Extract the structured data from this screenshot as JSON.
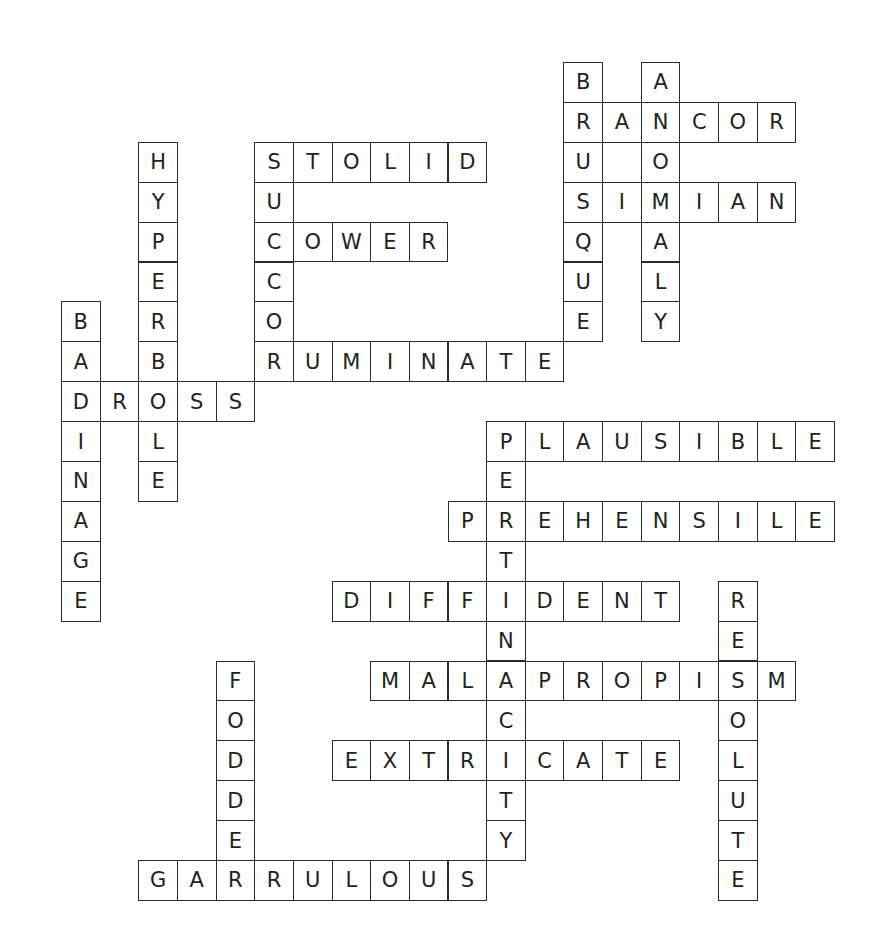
{
  "puzzle": {
    "type": "crossword-solution",
    "grid": {
      "origin_x": 61,
      "origin_y": 62,
      "cell_w": 38.65,
      "cell_h": 39.9
    },
    "colors": {
      "border": "#2a2a2a",
      "letter": "#222222",
      "background": "#ffffff"
    },
    "words": [
      {
        "word": "BRUSQUE",
        "dir": "down",
        "row": 0,
        "col": 13
      },
      {
        "word": "ANOMALY",
        "dir": "down",
        "row": 0,
        "col": 15
      },
      {
        "word": "RANCOR",
        "dir": "across",
        "row": 1,
        "col": 13
      },
      {
        "word": "SIMIAN",
        "dir": "across",
        "row": 3,
        "col": 13
      },
      {
        "word": "HYPERBOLE",
        "dir": "down",
        "row": 2,
        "col": 2
      },
      {
        "word": "STOLID",
        "dir": "across",
        "row": 2,
        "col": 5
      },
      {
        "word": "SUCCOR",
        "dir": "down",
        "row": 2,
        "col": 5
      },
      {
        "word": "COWER",
        "dir": "across",
        "row": 4,
        "col": 5
      },
      {
        "word": "RUMINATE",
        "dir": "across",
        "row": 7,
        "col": 5
      },
      {
        "word": "BADINAGE",
        "dir": "down",
        "row": 6,
        "col": 0
      },
      {
        "word": "DROSS",
        "dir": "across",
        "row": 8,
        "col": 0
      },
      {
        "word": "PLAUSIBLE",
        "dir": "across",
        "row": 9,
        "col": 11
      },
      {
        "word": "PERTINACITY",
        "dir": "down",
        "row": 9,
        "col": 11
      },
      {
        "word": "PREHENSILE",
        "dir": "across",
        "row": 11,
        "col": 10
      },
      {
        "word": "DIFFIDENT",
        "dir": "across",
        "row": 13,
        "col": 7
      },
      {
        "word": "RESOLUTE",
        "dir": "down",
        "row": 13,
        "col": 17
      },
      {
        "word": "MALAPROPISM",
        "dir": "across",
        "row": 15,
        "col": 8
      },
      {
        "word": "FODDER",
        "dir": "down",
        "row": 15,
        "col": 4
      },
      {
        "word": "EXTRICATE",
        "dir": "across",
        "row": 17,
        "col": 7
      },
      {
        "word": "GARRULOUS",
        "dir": "across",
        "row": 20,
        "col": 2
      }
    ]
  }
}
